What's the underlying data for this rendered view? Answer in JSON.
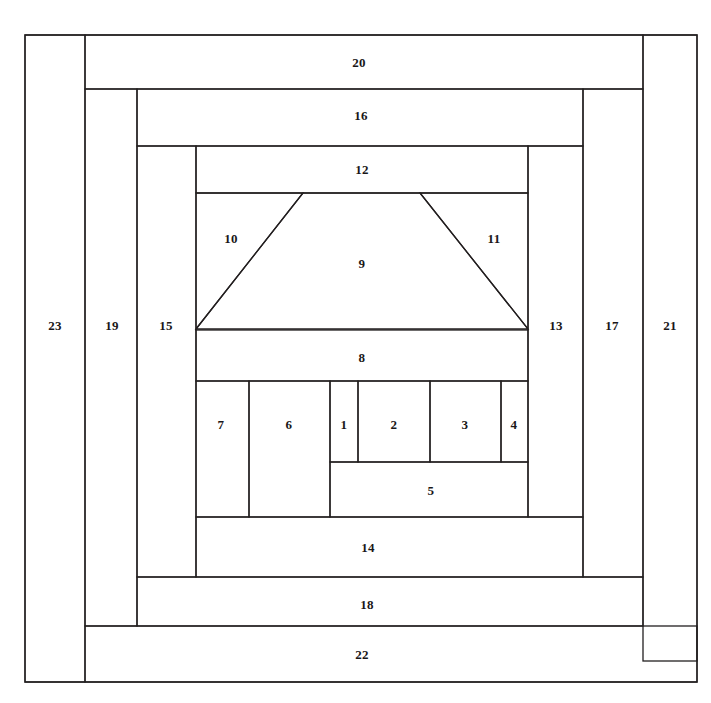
{
  "figure": {
    "kind": "quilt-block-piecing-diagram",
    "background_color": "#ffffff",
    "line_color": "#231f20",
    "label_color": "#1a1718",
    "canvas": {
      "width": 711,
      "height": 703
    }
  },
  "regions": [
    {
      "id": "region-1",
      "label": "1",
      "shape": "rect",
      "x": 330,
      "y": 381,
      "w": 28,
      "h": 81,
      "label_x": 344,
      "label_y": 426
    },
    {
      "id": "region-2",
      "label": "2",
      "shape": "rect",
      "x": 358,
      "y": 381,
      "w": 72,
      "h": 81,
      "label_x": 394,
      "label_y": 426
    },
    {
      "id": "region-3",
      "label": "3",
      "shape": "rect",
      "x": 430,
      "y": 381,
      "w": 71,
      "h": 81,
      "label_x": 465,
      "label_y": 426
    },
    {
      "id": "region-4",
      "label": "4",
      "shape": "rect",
      "x": 501,
      "y": 381,
      "w": 27,
      "h": 81,
      "label_x": 514,
      "label_y": 426
    },
    {
      "id": "region-5",
      "label": "5",
      "shape": "rect",
      "x": 330,
      "y": 462,
      "w": 198,
      "h": 55,
      "label_x": 431,
      "label_y": 492
    },
    {
      "id": "region-6",
      "label": "6",
      "shape": "rect",
      "x": 249,
      "y": 381,
      "w": 81,
      "h": 136,
      "label_x": 289,
      "label_y": 426
    },
    {
      "id": "region-7",
      "label": "7",
      "shape": "rect",
      "x": 196,
      "y": 381,
      "w": 53,
      "h": 136,
      "label_x": 221,
      "label_y": 426
    },
    {
      "id": "region-8",
      "label": "8",
      "shape": "rect",
      "x": 196,
      "y": 330,
      "w": 332,
      "h": 51,
      "label_x": 362,
      "label_y": 359
    },
    {
      "id": "region-9",
      "label": "9",
      "shape": "trapezoid",
      "points": "196,329 303,193 420,193 528,329",
      "label_x": 362,
      "label_y": 265
    },
    {
      "id": "region-10",
      "label": "10",
      "shape": "triangle",
      "points": "196,193 303,193 196,329",
      "label_x": 231,
      "label_y": 240
    },
    {
      "id": "region-11",
      "label": "11",
      "shape": "triangle",
      "points": "420,193 528,193 528,329",
      "label_x": 494,
      "label_y": 240
    },
    {
      "id": "region-12",
      "label": "12",
      "shape": "rect",
      "x": 196,
      "y": 146,
      "w": 332,
      "h": 47,
      "label_x": 362,
      "label_y": 171
    },
    {
      "id": "region-13",
      "label": "13",
      "shape": "rect",
      "x": 528,
      "y": 146,
      "w": 55,
      "h": 371,
      "label_x": 556,
      "label_y": 327
    },
    {
      "id": "region-14",
      "label": "14",
      "shape": "rect",
      "x": 196,
      "y": 517,
      "w": 387,
      "h": 60,
      "label_x": 368,
      "label_y": 549
    },
    {
      "id": "region-15",
      "label": "15",
      "shape": "rect",
      "x": 137,
      "y": 146,
      "w": 59,
      "h": 431,
      "label_x": 166,
      "label_y": 327
    },
    {
      "id": "region-16",
      "label": "16",
      "shape": "rect",
      "x": 137,
      "y": 89,
      "w": 446,
      "h": 57,
      "label_x": 361,
      "label_y": 117
    },
    {
      "id": "region-17",
      "label": "17",
      "shape": "rect",
      "x": 583,
      "y": 89,
      "w": 60,
      "h": 488,
      "label_x": 612,
      "label_y": 327
    },
    {
      "id": "region-18",
      "label": "18",
      "shape": "rect",
      "x": 137,
      "y": 577,
      "w": 506,
      "h": 49,
      "label_x": 367,
      "label_y": 606
    },
    {
      "id": "region-19",
      "label": "19",
      "shape": "rect",
      "x": 85,
      "y": 89,
      "w": 52,
      "h": 537,
      "label_x": 112,
      "label_y": 327
    },
    {
      "id": "region-20",
      "label": "20",
      "shape": "rect",
      "x": 85,
      "y": 35,
      "w": 558,
      "h": 54,
      "label_x": 359,
      "label_y": 64
    },
    {
      "id": "region-21",
      "label": "21",
      "shape": "rect",
      "x": 643,
      "y": 35,
      "w": 54,
      "h": 626,
      "label_x": 670,
      "label_y": 327
    },
    {
      "id": "region-22",
      "label": "22",
      "shape": "rect",
      "x": 85,
      "y": 626,
      "w": 612,
      "h": 56,
      "label_x": 362,
      "label_y": 656
    },
    {
      "id": "region-23",
      "label": "23",
      "shape": "rect",
      "x": 25,
      "y": 35,
      "w": 60,
      "h": 647,
      "label_x": 55,
      "label_y": 327
    }
  ],
  "extra_lines": [
    {
      "id": "outer-frame",
      "points": "25,35 697,35 697,682 25,682 25,35"
    }
  ]
}
